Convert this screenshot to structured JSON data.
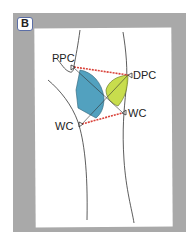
{
  "panel": {
    "badge_label": "B"
  },
  "labels": {
    "ppc": "PPC",
    "dpc": "DPC",
    "wc_left": "WC",
    "wc_right": "WC"
  },
  "colors": {
    "frame": "#a9a9a9",
    "paper": "#ffffff",
    "blue_region": "#3f97b8",
    "green_region": "#c2d93a",
    "red_line": "#d9423a",
    "outline": "#333333",
    "badge_border": "#5b6ea6"
  }
}
